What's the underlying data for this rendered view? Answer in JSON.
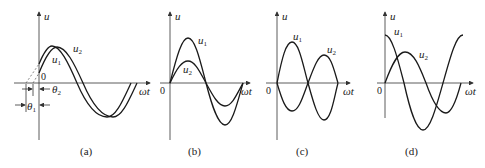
{
  "figure": {
    "axis_labels": {
      "y": "u",
      "x": "ωt",
      "origin": "0"
    },
    "panels": [
      {
        "id": "a",
        "caption": "(a)",
        "curves": [
          {
            "name": "u",
            "sub": "1"
          },
          {
            "name": "u",
            "sub": "2"
          }
        ],
        "angles": [
          {
            "name": "θ",
            "sub": "1"
          },
          {
            "name": "θ",
            "sub": "2"
          }
        ]
      },
      {
        "id": "b",
        "caption": "(b)",
        "curves": [
          {
            "name": "u",
            "sub": "1"
          },
          {
            "name": "u",
            "sub": "2"
          }
        ]
      },
      {
        "id": "c",
        "caption": "(c)",
        "curves": [
          {
            "name": "u",
            "sub": "1"
          },
          {
            "name": "u",
            "sub": "2"
          }
        ]
      },
      {
        "id": "d",
        "caption": "(d)",
        "curves": [
          {
            "name": "u",
            "sub": "1"
          },
          {
            "name": "u",
            "sub": "2"
          }
        ]
      }
    ]
  }
}
